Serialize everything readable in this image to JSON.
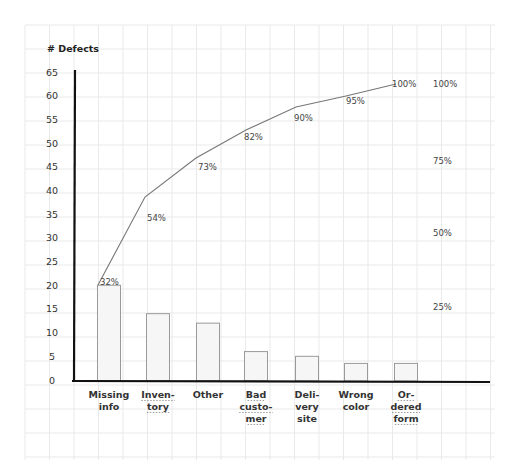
{
  "chart_data": {
    "type": "bar",
    "subtype": "pareto",
    "title": "",
    "ylabel": "# Defects",
    "xlabel": "",
    "ylim": [
      0,
      65
    ],
    "yticks": [
      0,
      5,
      10,
      15,
      20,
      25,
      30,
      35,
      40,
      45,
      50,
      55,
      60,
      65
    ],
    "categories": [
      [
        "Missing",
        "info"
      ],
      [
        "Inven-",
        "tory"
      ],
      [
        "Other"
      ],
      [
        "Bad",
        "custo-",
        "mer"
      ],
      [
        "Deli-",
        "very",
        "site"
      ],
      [
        "Wrong",
        "color"
      ],
      [
        "Or-",
        "dered",
        "form"
      ]
    ],
    "category_names": [
      "Missing info",
      "Inventory",
      "Other",
      "Bad customer",
      "Delivery site",
      "Wrong color",
      "Ordered form"
    ],
    "underlined_labels": [
      false,
      true,
      false,
      true,
      false,
      false,
      true
    ],
    "series": [
      {
        "name": "# Defects",
        "type": "bar",
        "values": [
          20,
          14,
          12,
          6,
          5,
          3.5,
          3.5
        ]
      },
      {
        "name": "Cumulative %",
        "type": "line",
        "values": [
          32,
          54,
          73,
          82,
          90,
          95,
          100
        ],
        "labels": [
          "32%",
          "54%",
          "73%",
          "82%",
          "90%",
          "95%",
          "100%"
        ]
      }
    ],
    "secondary_axis": {
      "labels": [
        "100%",
        "75%",
        "50%",
        "25%"
      ],
      "values": [
        100,
        75,
        50,
        25
      ]
    },
    "grid": true,
    "legend": "none"
  },
  "colors": {
    "bar_fill": "#f6f6f6",
    "bar_stroke": "#9a9a9a",
    "axis": "#111111",
    "line": "#777777",
    "grid": "#e9e9e9"
  }
}
